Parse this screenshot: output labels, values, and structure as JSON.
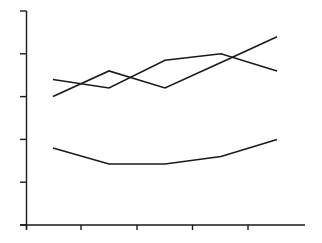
{
  "chart_data": {
    "type": "line",
    "title": "",
    "xlabel": "",
    "ylabel": "",
    "categories": [
      "",
      "",
      "",
      "",
      ""
    ],
    "ylim": [
      0,
      100
    ],
    "yticks": [
      0,
      20,
      40,
      60,
      80,
      100
    ],
    "ytick_labels": [
      "",
      "",
      "",
      "",
      "",
      ""
    ],
    "grid": false,
    "legend": null,
    "series": [
      {
        "name": "Series A",
        "values": [
          68,
          64,
          77,
          80,
          72
        ],
        "color": "#1a1a1a"
      },
      {
        "name": "Series B",
        "values": [
          60,
          72,
          64,
          76,
          88
        ],
        "color": "#1a1a1a"
      },
      {
        "name": "Series C",
        "values": [
          36,
          28.5,
          28.5,
          32,
          40
        ],
        "color": "#1a1a1a"
      }
    ]
  },
  "style": {
    "axis_color": "#1a1a1a",
    "line_color": "#1a1a1a",
    "background": "#ffffff"
  }
}
